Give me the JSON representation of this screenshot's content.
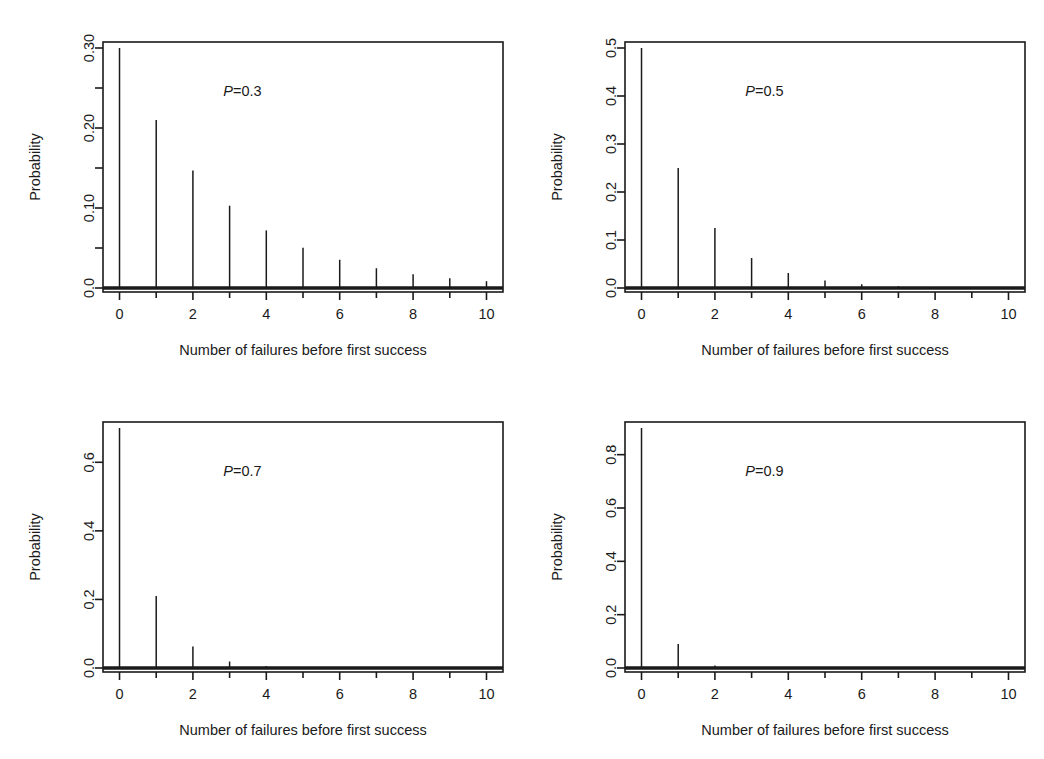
{
  "figure": {
    "background": "#ffffff",
    "ink": "#1a1a1a",
    "layout": "2x2 grid of stem plots",
    "panel_count": 4
  },
  "common": {
    "xlabel": "Number of failures before first success",
    "ylabel": "Probability",
    "x_ticks": [
      "0",
      "2",
      "4",
      "6",
      "8",
      "10"
    ],
    "x_tick_values": [
      0,
      2,
      4,
      6,
      8,
      10
    ],
    "xlim": [
      -0.45,
      10.45
    ]
  },
  "panels": [
    {
      "id": "panel-p03",
      "position": "top-left",
      "annotation_p": "P",
      "annotation_value": "=0.3",
      "annotation_full": "P=0.3",
      "y_ticks": [
        "0.0",
        "0.10",
        "0.20",
        "0.30"
      ],
      "y_tick_values": [
        0.0,
        0.1,
        0.2,
        0.3
      ],
      "y_minor_values": [
        0.05,
        0.15,
        0.25
      ],
      "ylim": [
        -0.012,
        0.315
      ]
    },
    {
      "id": "panel-p05",
      "position": "top-right",
      "annotation_p": "P",
      "annotation_value": "=0.5",
      "annotation_full": "P=0.5",
      "y_ticks": [
        "0.0",
        "0.1",
        "0.2",
        "0.3",
        "0.4",
        "0.5"
      ],
      "y_tick_values": [
        0.0,
        0.1,
        0.2,
        0.3,
        0.4,
        0.5
      ],
      "y_minor_values": [],
      "ylim": [
        -0.02,
        0.525
      ]
    },
    {
      "id": "panel-p07",
      "position": "bottom-left",
      "annotation_p": "P",
      "annotation_value": "=0.7",
      "annotation_full": "P=0.7",
      "y_ticks": [
        "0.0",
        "0.2",
        "0.4",
        "0.6"
      ],
      "y_tick_values": [
        0.0,
        0.2,
        0.4,
        0.6
      ],
      "y_minor_values": [],
      "ylim": [
        -0.028,
        0.735
      ]
    },
    {
      "id": "panel-p09",
      "position": "bottom-right",
      "annotation_p": "P",
      "annotation_value": "=0.9",
      "annotation_full": "P=0.9",
      "y_ticks": [
        "0.0",
        "0.2",
        "0.4",
        "0.6",
        "0.8"
      ],
      "y_tick_values": [
        0.0,
        0.2,
        0.4,
        0.6,
        0.8
      ],
      "y_minor_values": [],
      "ylim": [
        -0.036,
        0.945
      ]
    }
  ],
  "chart_data": [
    {
      "type": "bar",
      "subtype": "stem-plot",
      "title": "P=0.3",
      "xlabel": "Number of failures before first success",
      "ylabel": "Probability",
      "categories": [
        0,
        1,
        2,
        3,
        4,
        5,
        6,
        7,
        8,
        9,
        10
      ],
      "values": [
        0.3,
        0.21,
        0.147,
        0.1029,
        0.072,
        0.0504,
        0.0353,
        0.0247,
        0.0173,
        0.0121,
        0.0085
      ],
      "xlim": [
        -0.45,
        10.45
      ],
      "ylim": [
        0.0,
        0.3
      ],
      "x_ticks": [
        0,
        2,
        4,
        6,
        8,
        10
      ],
      "y_ticks": [
        0.0,
        0.1,
        0.2,
        0.3
      ],
      "y_tick_labels": [
        "0.0",
        "0.10",
        "0.20",
        "0.30"
      ],
      "grid": false,
      "legend": "none",
      "annotations": [
        "P=0.3"
      ]
    },
    {
      "type": "bar",
      "subtype": "stem-plot",
      "title": "P=0.5",
      "xlabel": "Number of failures before first success",
      "ylabel": "Probability",
      "categories": [
        0,
        1,
        2,
        3,
        4,
        5,
        6,
        7,
        8,
        9,
        10
      ],
      "values": [
        0.5,
        0.25,
        0.125,
        0.0625,
        0.0313,
        0.0156,
        0.0078,
        0.0039,
        0.002,
        0.001,
        0.0005
      ],
      "xlim": [
        -0.45,
        10.45
      ],
      "ylim": [
        0.0,
        0.5
      ],
      "x_ticks": [
        0,
        2,
        4,
        6,
        8,
        10
      ],
      "y_ticks": [
        0.0,
        0.1,
        0.2,
        0.3,
        0.4,
        0.5
      ],
      "y_tick_labels": [
        "0.0",
        "0.1",
        "0.2",
        "0.3",
        "0.4",
        "0.5"
      ],
      "grid": false,
      "legend": "none",
      "annotations": [
        "P=0.5"
      ]
    },
    {
      "type": "bar",
      "subtype": "stem-plot",
      "title": "P=0.7",
      "xlabel": "Number of failures before first success",
      "ylabel": "Probability",
      "categories": [
        0,
        1,
        2,
        3,
        4,
        5,
        6,
        7,
        8,
        9,
        10
      ],
      "values": [
        0.7,
        0.21,
        0.063,
        0.0189,
        0.0057,
        0.0017,
        0.0005,
        0.0002,
        4e-05,
        1e-05,
        4e-06
      ],
      "xlim": [
        -0.45,
        10.45
      ],
      "ylim": [
        0.0,
        0.7
      ],
      "x_ticks": [
        0,
        2,
        4,
        6,
        8,
        10
      ],
      "y_ticks": [
        0.0,
        0.2,
        0.4,
        0.6
      ],
      "y_tick_labels": [
        "0.0",
        "0.2",
        "0.4",
        "0.6"
      ],
      "grid": false,
      "legend": "none",
      "annotations": [
        "P=0.7"
      ]
    },
    {
      "type": "bar",
      "subtype": "stem-plot",
      "title": "P=0.9",
      "xlabel": "Number of failures before first success",
      "ylabel": "Probability",
      "categories": [
        0,
        1,
        2,
        3,
        4,
        5,
        6,
        7,
        8,
        9,
        10
      ],
      "values": [
        0.9,
        0.09,
        0.009,
        0.0009,
        9e-05,
        9e-06,
        9e-07,
        9e-08,
        9e-09,
        9e-10,
        9e-11
      ],
      "xlim": [
        -0.45,
        10.45
      ],
      "ylim": [
        0.0,
        0.9
      ],
      "x_ticks": [
        0,
        2,
        4,
        6,
        8,
        10
      ],
      "y_ticks": [
        0.0,
        0.2,
        0.4,
        0.6,
        0.8
      ],
      "y_tick_labels": [
        "0.0",
        "0.2",
        "0.4",
        "0.6",
        "0.8"
      ],
      "grid": false,
      "legend": "none",
      "annotations": [
        "P=0.9"
      ]
    }
  ]
}
